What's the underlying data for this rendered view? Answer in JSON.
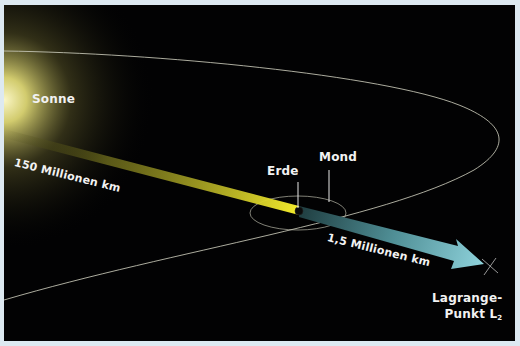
{
  "diagram": {
    "labels": {
      "sun": "Sonne",
      "earth": "Erde",
      "moon": "Mond",
      "distance_sun_earth": "150 Millionen km",
      "distance_earth_l2": "1,5 Millionen km",
      "l2_line1": "Lagrange-",
      "l2_line2": "Punkt L",
      "l2_sub": "2"
    },
    "colors": {
      "background": "#020203",
      "frame": "#dde9f1",
      "sun_glow": "#f4ef9a",
      "beam_sun_earth": "#f2ea2a",
      "arrow_earth_l2": "#7cc3cc",
      "orbit_line": "#c9c9b8",
      "label_text": "#f2f2f2"
    }
  }
}
